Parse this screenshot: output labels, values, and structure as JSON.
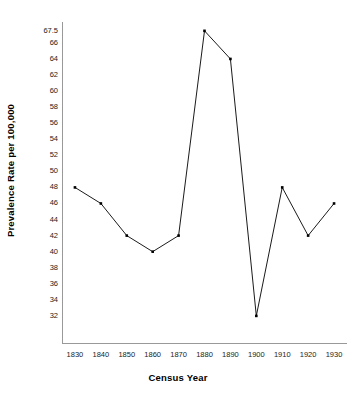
{
  "chart_data": {
    "type": "line",
    "title": "",
    "xlabel": "Census Year",
    "ylabel": "Prevalence Rate per 100,000",
    "x": [
      1830,
      1840,
      1850,
      1860,
      1870,
      1880,
      1890,
      1900,
      1910,
      1920,
      1930
    ],
    "values": [
      48,
      46,
      42,
      40,
      42,
      67.5,
      64,
      32,
      48,
      42,
      46
    ],
    "categories": [
      "1830",
      "1840",
      "1850",
      "1860",
      "1870",
      "1880",
      "1890",
      "1900",
      "1910",
      "1920",
      "1930"
    ],
    "xtick_labels": [
      "1830",
      "1840",
      "1850",
      "1860",
      "1870",
      "1880",
      "1890",
      "1900",
      "1910",
      "1920",
      "1930"
    ],
    "ytick_labels": [
      "32",
      "34",
      "36",
      "38",
      "40",
      "42",
      "44",
      "46",
      "48",
      "50",
      "52",
      "54",
      "56",
      "58",
      "60",
      "62",
      "64",
      "66",
      "67.5"
    ],
    "ytick_values": [
      32,
      34,
      36,
      38,
      40,
      42,
      44,
      46,
      48,
      50,
      52,
      54,
      56,
      58,
      60,
      62,
      64,
      66,
      67.5
    ],
    "xlim": [
      1825,
      1935
    ],
    "ylim": [
      28.5,
      68.6
    ],
    "grid": false,
    "legend": null,
    "marker": "square",
    "line_color": "#000000",
    "marker_color": "#000000",
    "axis_color": "#999999",
    "background_color": "#ffffff",
    "annotations": []
  },
  "axis": {
    "y_title": "Prevalence Rate per 100,000",
    "x_title": "Census Year"
  }
}
